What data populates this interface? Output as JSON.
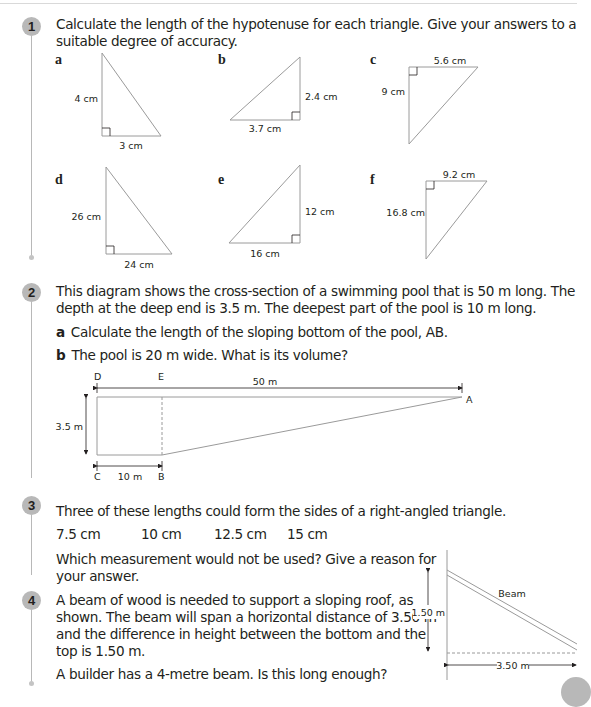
{
  "questions": [
    {
      "number": "1",
      "text_line1": "Calculate the length of the hypotenuse for each triangle. Give your answers to a",
      "text_line2": "suitable degree of accuracy.",
      "triangles": [
        {
          "label": "a",
          "side1": "4 cm",
          "side2": "3 cm"
        },
        {
          "label": "b",
          "side1": "2.4 cm",
          "side2": "3.7 cm"
        },
        {
          "label": "c",
          "side1": "5.6 cm",
          "side2": "9 cm"
        },
        {
          "label": "d",
          "side1": "26 cm",
          "side2": "24 cm"
        },
        {
          "label": "e",
          "side1": "12 cm",
          "side2": "16 cm"
        },
        {
          "label": "f",
          "side1": "9.2 cm",
          "side2": "16.8 cm"
        }
      ]
    },
    {
      "number": "2",
      "text_line1": "This diagram shows the cross-section of a swimming pool that is 50 m long. The",
      "text_line2": "depth at the deep end is 3.5 m. The deepest part of the pool is 10 m long.",
      "parts": [
        {
          "label": "a",
          "text": "Calculate the length of the sloping bottom of the pool, AB."
        },
        {
          "label": "b",
          "text": "The pool is 20 m wide. What is its volume?"
        }
      ],
      "diagram": {
        "points": {
          "A": "A",
          "B": "B",
          "C": "C",
          "D": "D",
          "E": "E"
        },
        "length_label": "50 m",
        "depth_label": "3.5 m",
        "deep_part_label": "10 m"
      }
    },
    {
      "number": "3",
      "text": "Three of these lengths could form the sides of a right-angled triangle.",
      "lengths": [
        "7.5 cm",
        "10 cm",
        "12.5 cm",
        "15 cm"
      ],
      "question_line1": "Which measurement would not be used? Give a reason for",
      "question_line2": "your answer."
    },
    {
      "number": "4",
      "lines": [
        "A beam of wood is needed to support a sloping roof, as",
        "shown. The beam will span a horizontal distance of 3.50 m",
        "and the difference in height between the bottom and the",
        "top is 1.50 m."
      ],
      "question": "A builder has a 4-metre beam. Is this long enough?",
      "diagram": {
        "beam_label": "Beam",
        "height_label": "1.50 m",
        "width_label": "3.50 m"
      }
    }
  ]
}
